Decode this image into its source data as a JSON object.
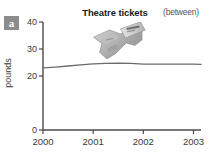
{
  "panel": {
    "letter": "a",
    "badge_color": "#8c8c8c"
  },
  "title": "Theatre tickets",
  "note": "(between)",
  "photo": {
    "icon_name": "theatre-ticket-photo",
    "alt": "theatre ticket"
  },
  "chart_data": {
    "type": "line",
    "title": "Theatre tickets",
    "xlabel": "",
    "ylabel": "pounds",
    "xlim": [
      2000,
      2003.15
    ],
    "ylim": [
      0,
      40
    ],
    "xticks": [
      2000,
      2001,
      2002,
      2003
    ],
    "xticklabels": [
      "2000",
      "2001",
      "2002",
      "2003"
    ],
    "yticks": [
      0,
      20,
      30,
      40
    ],
    "yticklabels": [
      "0",
      "20",
      "30",
      "40"
    ],
    "grid": false,
    "legend": null,
    "line_color": "#6b6b6b",
    "series": [
      {
        "name": "Theatre tickets",
        "x": [
          2000.0,
          2000.25,
          2000.5,
          2000.75,
          2001.0,
          2001.25,
          2001.5,
          2001.75,
          2002.0,
          2002.25,
          2002.5,
          2002.75,
          2003.0,
          2003.15
        ],
        "values": [
          23.0,
          23.3,
          23.7,
          24.1,
          24.5,
          24.7,
          24.8,
          24.7,
          24.4,
          24.4,
          24.4,
          24.4,
          24.4,
          24.3
        ]
      }
    ]
  },
  "axis_geometry": {
    "x0": 43,
    "x1": 201,
    "y_top": 22,
    "y_zero": 130
  }
}
